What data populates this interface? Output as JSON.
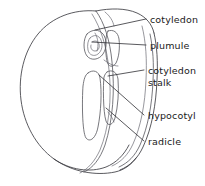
{
  "figure": {
    "background_color": "#ffffff",
    "line_color": "#3c3c42",
    "text_color": "#1a1a1a",
    "width": 205,
    "height": 186
  },
  "labels": {
    "cotyledon": "cotyledon",
    "plumule": "plumule",
    "cotyledon_stalk_line1": "cotyledon",
    "cotyledon_stalk_line2": "stalk",
    "hypocotyl": "hypocotyl",
    "radicle": "radicle"
  },
  "leaders": [
    {
      "name": "cotyledon",
      "from_x": 95,
      "from_y": 30,
      "to_x": 146,
      "to_y": 19
    },
    {
      "name": "plumule",
      "from_x": 92,
      "from_y": 42,
      "to_x": 146,
      "to_y": 45
    },
    {
      "name": "cotyledon-stalk",
      "from_x": 108,
      "from_y": 76,
      "to_x": 144,
      "to_y": 70
    },
    {
      "name": "hypocotyl",
      "from_x": 99,
      "from_y": 75,
      "to_x": 144,
      "to_y": 115
    },
    {
      "name": "radicle",
      "from_x": 106,
      "from_y": 108,
      "to_x": 144,
      "to_y": 141
    }
  ]
}
